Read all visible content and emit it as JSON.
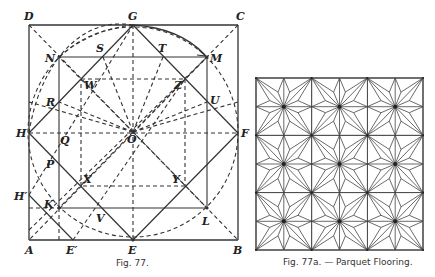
{
  "figures": [
    {
      "id": "fig77",
      "caption": "Fig. 77.",
      "points": {
        "A": "A",
        "B": "B",
        "C": "C",
        "D": "D",
        "E": "E",
        "F": "F",
        "G": "G",
        "H": "H",
        "Hp": "H′",
        "Ep": "E′",
        "K": "K",
        "L": "L",
        "M": "M",
        "N": "N",
        "O": "O",
        "P": "P",
        "Q": "Q",
        "R": "R",
        "S": "S",
        "T": "T",
        "U": "U",
        "V": "V",
        "W": "W",
        "X": "X",
        "Y": "Y",
        "Z": "Z"
      }
    },
    {
      "id": "fig77a",
      "caption": "Fig. 77a. — Parquet Flooring.",
      "grid": {
        "rows": 3,
        "cols": 3
      }
    }
  ],
  "colors": {
    "ink": "#333333",
    "paper": "#ffffff"
  }
}
